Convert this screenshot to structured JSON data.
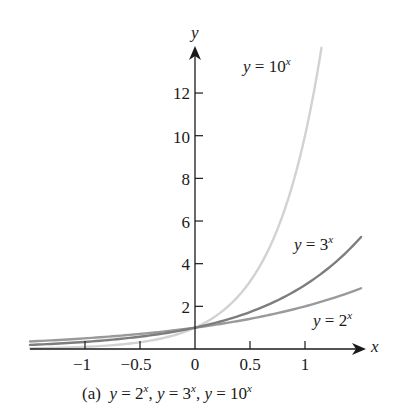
{
  "chart_data": {
    "type": "line",
    "title": "",
    "caption": {
      "prefix": "(a)",
      "parts": [
        {
          "lhs": "y",
          "base": "2",
          "exp": "x"
        },
        {
          "lhs": "y",
          "base": "3",
          "exp": "x"
        },
        {
          "lhs": "y",
          "base": "10",
          "exp": "x"
        }
      ]
    },
    "xlabel": "x",
    "ylabel": "y",
    "xlim": [
      -1.5,
      1.55
    ],
    "ylim": [
      0,
      14
    ],
    "x_ticks": [
      -1,
      -0.5,
      0,
      0.5,
      1
    ],
    "x_tick_labels": [
      "−1",
      "−0.5",
      "0",
      "0.5",
      "1"
    ],
    "y_ticks": [
      2,
      4,
      6,
      8,
      10,
      12
    ],
    "y_tick_labels": [
      "2",
      "4",
      "6",
      "8",
      "10",
      "12"
    ],
    "grid": false,
    "legend": "inline labels",
    "series": [
      {
        "name": "y = 2^x",
        "base": 2,
        "x_range": [
          -1.5,
          1.51
        ],
        "color": "#9a9a9a",
        "x": [
          -1.5,
          -1,
          -0.5,
          0,
          0.5,
          1,
          1.5
        ],
        "values": [
          0.35,
          0.5,
          0.71,
          1,
          1.41,
          2,
          2.83
        ],
        "label": {
          "lhs": "y",
          "base": "2",
          "exp": "x"
        }
      },
      {
        "name": "y = 3^x",
        "base": 3,
        "x_range": [
          -1.5,
          1.51
        ],
        "color": "#7d7d7d",
        "x": [
          -1.5,
          -1,
          -0.5,
          0,
          0.5,
          1,
          1.5
        ],
        "values": [
          0.19,
          0.33,
          0.58,
          1,
          1.73,
          3,
          5.2
        ],
        "label": {
          "lhs": "y",
          "base": "3",
          "exp": "x"
        }
      },
      {
        "name": "y = 10^x",
        "base": 10,
        "x_range": [
          -1.5,
          1.15
        ],
        "color": "#d2d2d2",
        "x": [
          -1.5,
          -1,
          -0.5,
          0,
          0.5,
          1,
          1.15
        ],
        "values": [
          0.03,
          0.1,
          0.32,
          1,
          3.16,
          10,
          14.1
        ],
        "label": {
          "lhs": "y",
          "base": "10",
          "exp": "x"
        }
      }
    ]
  },
  "labels": {
    "eq": "=",
    "comma": ","
  }
}
